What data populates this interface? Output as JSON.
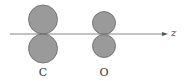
{
  "diagram": {
    "axis": {
      "label": "z",
      "y": 34,
      "x_start": 10,
      "x_end": 168
    },
    "atoms": [
      {
        "label": "C",
        "cx": 43,
        "lobe_radius": 15
      },
      {
        "label": "O",
        "cx": 104,
        "lobe_radius": 12
      }
    ],
    "colors": {
      "lobe_fill": "#9a9a9a",
      "lobe_stroke": "#666666",
      "axis": "#777777"
    }
  }
}
